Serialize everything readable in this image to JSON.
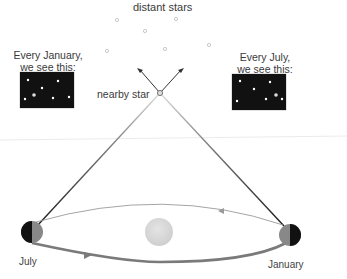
{
  "labels": {
    "distant_stars": "distant stars",
    "nearby_star": "nearby star",
    "january_view_line1": "Every January,",
    "january_view_line2": "we see this:",
    "july_view_line1": "Every July,",
    "july_view_line2": "we see this:",
    "earth_july": "July",
    "earth_january": "January"
  },
  "colors": {
    "background": "#ffffff",
    "sky_panel": "#111111",
    "sight_line": "#222222",
    "orbit": "#8a8a8a",
    "sun": "#d6d6d6",
    "distant_star": "#b5b5b5"
  },
  "distant_stars": [
    {
      "x": 117,
      "y": 20
    },
    {
      "x": 176,
      "y": 19
    },
    {
      "x": 145,
      "y": 31
    },
    {
      "x": 107,
      "y": 51
    },
    {
      "x": 165,
      "y": 49
    },
    {
      "x": 209,
      "y": 45
    }
  ]
}
